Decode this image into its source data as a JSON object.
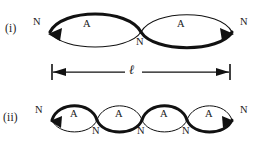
{
  "figure": {
    "background_color": "#ffffff",
    "ink_color": "#111111",
    "width": 263,
    "height": 142,
    "node_symbol": "N",
    "antinode_symbol": "A",
    "length_symbol": "ℓ"
  },
  "rows": [
    {
      "id": "row-i",
      "label": "(i)",
      "loops": 4,
      "visible_loops": 2,
      "node_labels": [
        "N",
        "N",
        "N"
      ],
      "antinode_labels": [
        "A",
        "A"
      ]
    },
    {
      "id": "row-ii",
      "label": "(ii)",
      "loops": 4,
      "visible_loops": 4,
      "node_labels": [
        "N",
        "N",
        "N",
        "N",
        "N"
      ],
      "antinode_labels": [
        "A",
        "A",
        "A",
        "A"
      ]
    }
  ],
  "dimension": {
    "label": "ℓ",
    "left_cap": "tick-with-left-arrow",
    "right_cap": "tick-with-right-arrow"
  },
  "labels_row_i": {
    "left_node": "N",
    "middle_node": "N",
    "right_node": "N",
    "antinode_1": "A",
    "antinode_2": "A"
  },
  "labels_row_ii": {
    "left_node": "N",
    "node_2": "N",
    "node_3": "N",
    "node_4": "N",
    "right_node": "N",
    "antinode_1": "A",
    "antinode_2": "A",
    "antinode_3": "A",
    "antinode_4": "A"
  }
}
